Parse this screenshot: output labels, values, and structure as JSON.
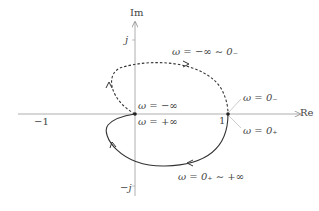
{
  "diagram": {
    "type": "nyquist-plot",
    "axes": {
      "x_label": "Re",
      "y_label": "Im"
    },
    "ticks": {
      "neg_one": "−1",
      "one": "1",
      "j": "j",
      "neg_j": "−j"
    },
    "labels": {
      "upper_branch": "ω = −∞ ∼ 0₋",
      "lower_branch": "ω = 0₊ ∼ +∞",
      "origin_minus": "ω = −∞",
      "origin_plus": "ω = +∞",
      "one_minus": "ω = 0₋",
      "one_plus": "ω = 0₊"
    },
    "colors": {
      "axis": "#888888",
      "curve": "#333333"
    }
  }
}
